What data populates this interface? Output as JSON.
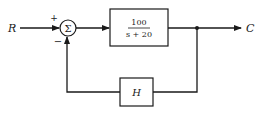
{
  "diagram": {
    "type": "feedback-control-block-diagram",
    "input_label": "R",
    "output_label": "C",
    "summing_junction": {
      "symbol": "Σ",
      "input_sign_top": "+",
      "input_sign_bottom": "−"
    },
    "forward_block": {
      "numerator": "100",
      "denominator": "s + 20"
    },
    "feedback_block": {
      "label": "H"
    },
    "colors": {
      "line": "#1a1a1a",
      "background": "#ffffff"
    }
  }
}
